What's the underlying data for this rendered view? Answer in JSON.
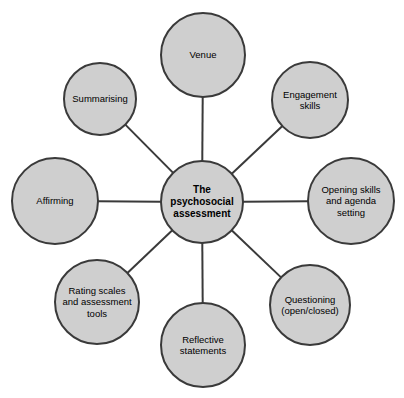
{
  "diagram": {
    "title": "The psychosocial assessment",
    "type": "radial-spoke-hub-diagram",
    "canvas": {
      "width": 404,
      "height": 398,
      "background": "#ffffff"
    },
    "style": {
      "node_fill": "#cfcfcf",
      "node_stroke": "#3a3a3a",
      "connector_stroke": "#3a3a3a",
      "text_color": "#000000"
    },
    "center": {
      "id": "center",
      "label": "The\npsychosocial\nassessment",
      "cx": 202,
      "cy": 202,
      "r": 42,
      "bold": true
    },
    "satellites": [
      {
        "id": "venue",
        "label": "Venue",
        "cx": 203,
        "cy": 55,
        "r": 43
      },
      {
        "id": "engagement",
        "label": "Engagement\nskills",
        "cx": 310,
        "cy": 100,
        "r": 39
      },
      {
        "id": "opening",
        "label": "Opening skills\nand agenda\nsetting",
        "cx": 351,
        "cy": 201,
        "r": 44
      },
      {
        "id": "questioning",
        "label": "Questioning\n(open/closed)",
        "cx": 310,
        "cy": 305,
        "r": 41
      },
      {
        "id": "reflective",
        "label": "Reflective\nstatements",
        "cx": 203,
        "cy": 345,
        "r": 43
      },
      {
        "id": "rating-scales",
        "label": "Rating scales\nand assessment\ntools",
        "cx": 97,
        "cy": 302,
        "r": 43
      },
      {
        "id": "affirming",
        "label": "Affirming",
        "cx": 55,
        "cy": 201,
        "r": 44
      },
      {
        "id": "summarising",
        "label": "Summarising",
        "cx": 100,
        "cy": 99,
        "r": 37
      }
    ],
    "connectors": [
      {
        "from": "center",
        "to": "venue"
      },
      {
        "from": "center",
        "to": "engagement"
      },
      {
        "from": "center",
        "to": "opening"
      },
      {
        "from": "center",
        "to": "questioning"
      },
      {
        "from": "center",
        "to": "reflective"
      },
      {
        "from": "center",
        "to": "rating-scales"
      },
      {
        "from": "center",
        "to": "affirming"
      },
      {
        "from": "center",
        "to": "summarising"
      }
    ]
  }
}
